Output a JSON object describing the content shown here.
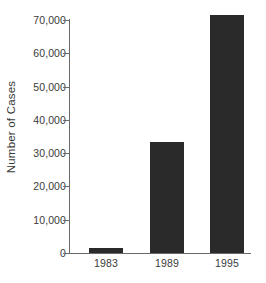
{
  "chart_data": {
    "type": "bar",
    "title": "",
    "subtitle": "",
    "xlabel": "",
    "ylabel": "Number of Cases",
    "categories": [
      "1983",
      "1989",
      "1995"
    ],
    "values": [
      1500,
      33300,
      71500
    ],
    "series": [
      {
        "name": "Number of Cases",
        "values": [
          1500,
          33300,
          71500
        ]
      }
    ],
    "ylim": [
      0,
      71500
    ],
    "yticks": [
      0,
      10000,
      20000,
      30000,
      40000,
      50000,
      60000,
      70000
    ],
    "ytick_labels": [
      "0",
      "10,000",
      "20,000",
      "30,000",
      "40,000",
      "50,000",
      "60,000",
      "70,000"
    ],
    "xtick_labels": [
      "1983",
      "1989",
      "1995"
    ],
    "grid": false,
    "legend": false,
    "legend_position": "none",
    "annotations": [],
    "bar_color": "#2a2a2a",
    "axis_color": "#6a6a6a",
    "text_color": "#3a3a3a",
    "background_color": "#ffffff",
    "axis_top_value": 70000,
    "tick_spacing_value": 10000
  }
}
